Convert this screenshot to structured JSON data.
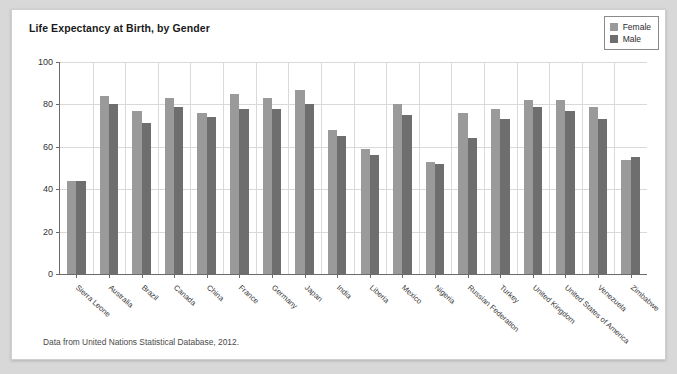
{
  "card": {
    "title": "Life Expectancy at Birth, by Gender",
    "source_note": "Data from United Nations Statistical Database, 2012."
  },
  "legend": {
    "position": "top-right",
    "entries": [
      {
        "label": "Female",
        "color": "#9a9a9a"
      },
      {
        "label": "Male",
        "color": "#6e6e6e"
      }
    ]
  },
  "chart_data": {
    "type": "bar",
    "title": "Life Expectancy at Birth, by Gender",
    "subtitle": "",
    "xlabel": "",
    "ylabel": "",
    "ylim": [
      0,
      100
    ],
    "yticks": [
      0,
      20,
      40,
      60,
      80,
      100
    ],
    "grid": true,
    "legend_position": "top-right",
    "annotations": [
      "Data from United Nations Statistical Database, 2012."
    ],
    "categories": [
      "Sierra Leone",
      "Australia",
      "Brazil",
      "Canada",
      "China",
      "France",
      "Germany",
      "Japan",
      "India",
      "Liberia",
      "Mexico",
      "Nigeria",
      "Russian Federation",
      "Turkey",
      "United Kingdom",
      "United States of America",
      "Venezuela",
      "Zimbabwe"
    ],
    "series": [
      {
        "name": "Female",
        "color": "#9a9a9a",
        "values": [
          44,
          84,
          77,
          83,
          76,
          85,
          83,
          87,
          68,
          59,
          80,
          53,
          76,
          78,
          82,
          82,
          79,
          54
        ]
      },
      {
        "name": "Male",
        "color": "#6e6e6e",
        "values": [
          44,
          80,
          71,
          79,
          74,
          78,
          78,
          80,
          65,
          56,
          75,
          52,
          64,
          73,
          79,
          77,
          73,
          55
        ]
      }
    ]
  }
}
